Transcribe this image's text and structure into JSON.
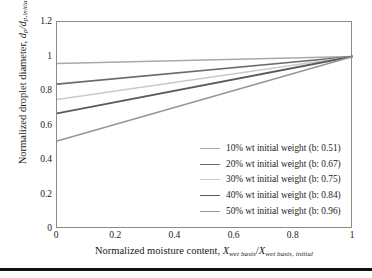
{
  "chart_data": {
    "type": "line",
    "title": "",
    "xlabel": "Normalized moisture content, X_wet basis/X_wet basis, initial",
    "ylabel": "Normalized droplet diameter, d_p/d_p,initial",
    "xlim": [
      0,
      1
    ],
    "ylim": [
      0,
      1.2
    ],
    "xticks": [
      "0",
      "0.2",
      "0.4",
      "0.6",
      "0.8",
      "1"
    ],
    "xtick_values": [
      0,
      0.2,
      0.4,
      0.6,
      0.8,
      1
    ],
    "yticks": [
      "0",
      "0.2",
      "0.4",
      "0.6",
      "0.8",
      "1",
      "1.2"
    ],
    "ytick_values": [
      0,
      0.2,
      0.4,
      0.6,
      0.8,
      1,
      1.2
    ],
    "grid": false,
    "legend_position": "lower right",
    "x": [
      0,
      1
    ],
    "series": [
      {
        "name": "10% wt initial weight (b: 0.51)",
        "b": 0.96,
        "values": [
          0.96,
          1.0
        ],
        "color": "#a9a9a9"
      },
      {
        "name": "20% wt initial weight (b: 0.67)",
        "b": 0.84,
        "values": [
          0.84,
          1.0
        ],
        "color": "#6b6b6b"
      },
      {
        "name": "30% wt initial weight (b: 0.75)",
        "b": 0.75,
        "values": [
          0.75,
          1.0
        ],
        "color": "#cacaca"
      },
      {
        "name": "40% wt initial weight (b: 0.84)",
        "b": 0.67,
        "values": [
          0.67,
          1.0
        ],
        "color": "#5a5a5a"
      },
      {
        "name": "50% wt initial weight (b: 0.96)",
        "b": 0.51,
        "values": [
          0.51,
          1.0
        ],
        "color": "#949494"
      }
    ]
  },
  "axes": {
    "y_title_main": "Normalized droplet diameter, ",
    "y_title_var1": "d",
    "y_title_sub1": "p",
    "y_title_slash": "/",
    "y_title_var2": "d",
    "y_title_sub2": "p,initial",
    "x_title_main": "Normalized moisture content, ",
    "x_title_var1": "X",
    "x_title_sub1": "wet basis",
    "x_title_slash": "/",
    "x_title_var2": "X",
    "x_title_sub2": "wet basis, initial"
  },
  "legend": {
    "items": [
      {
        "label": "10% wt initial weight (b: 0.51)"
      },
      {
        "label": "20% wt initial weight (b: 0.67)"
      },
      {
        "label": "30% wt initial weight (b: 0.75)"
      },
      {
        "label": "40% wt initial weight (b: 0.84)"
      },
      {
        "label": "50% wt initial weight (b: 0.96)"
      }
    ]
  },
  "colors": {
    "frame": "#8a8a8a",
    "text": "#1a1a1a",
    "rule": "#111111"
  }
}
